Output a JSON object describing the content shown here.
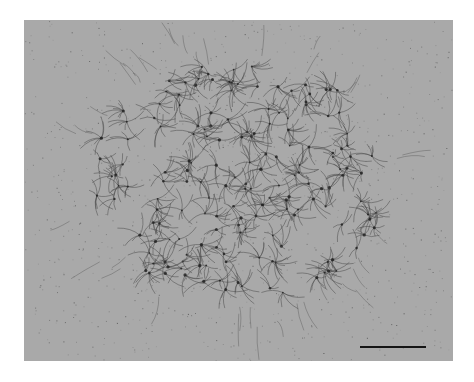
{
  "figure": {
    "type": "electron micrograph",
    "background_color": "#a9a9a9",
    "fiber_color": "#4a4a4a",
    "node_color": "#1e1e1e",
    "scale_bar": {
      "label": "",
      "color": "#151515",
      "length_px": 66
    }
  }
}
